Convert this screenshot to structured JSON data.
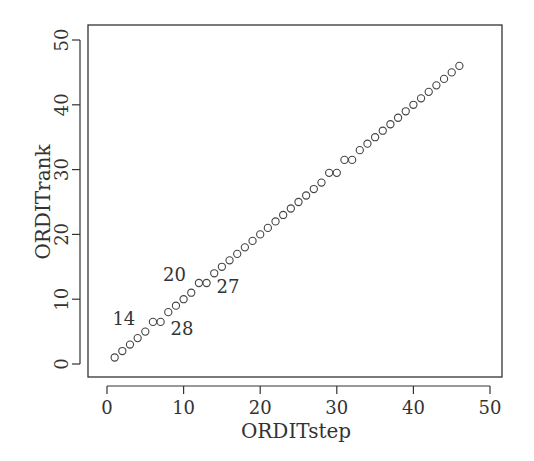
{
  "chart_data": {
    "type": "scatter",
    "title": "",
    "xlabel": "ORDITstep",
    "ylabel": "ORDITrank",
    "xlim": [
      -2,
      52
    ],
    "ylim": [
      -1.8,
      52.5
    ],
    "xticks": [
      0,
      10,
      20,
      30,
      40,
      50
    ],
    "yticks": [
      0,
      10,
      20,
      30,
      40,
      50
    ],
    "grid": false,
    "legend": null,
    "marker": "open-circle",
    "color": "#444444",
    "points": [
      [
        1,
        1
      ],
      [
        2,
        2
      ],
      [
        3,
        3
      ],
      [
        4,
        4
      ],
      [
        5,
        5
      ],
      [
        6,
        6.5
      ],
      [
        7,
        6.5
      ],
      [
        8,
        8
      ],
      [
        9,
        9
      ],
      [
        10,
        10
      ],
      [
        11,
        11
      ],
      [
        12,
        12.5
      ],
      [
        13,
        12.5
      ],
      [
        14,
        14
      ],
      [
        15,
        15
      ],
      [
        16,
        16
      ],
      [
        17,
        17
      ],
      [
        18,
        18
      ],
      [
        19,
        19
      ],
      [
        20,
        20
      ],
      [
        21,
        21
      ],
      [
        22,
        22
      ],
      [
        23,
        23
      ],
      [
        24,
        24
      ],
      [
        25,
        25
      ],
      [
        26,
        26
      ],
      [
        27,
        27
      ],
      [
        28,
        28
      ],
      [
        29,
        29.5
      ],
      [
        30,
        29.5
      ],
      [
        31,
        31.5
      ],
      [
        32,
        31.5
      ],
      [
        33,
        33
      ],
      [
        34,
        34
      ],
      [
        35,
        35
      ],
      [
        36,
        36
      ],
      [
        37,
        37
      ],
      [
        38,
        38
      ],
      [
        39,
        39
      ],
      [
        40,
        40
      ],
      [
        41,
        41
      ],
      [
        42,
        42
      ],
      [
        43,
        43
      ],
      [
        44,
        44
      ],
      [
        45,
        45
      ],
      [
        46,
        46
      ]
    ],
    "annotations": [
      {
        "text": "14",
        "x": 2.2,
        "y": 6.0
      },
      {
        "text": "28",
        "x": 9.8,
        "y": 4.5
      },
      {
        "text": "20",
        "x": 8.8,
        "y": 12.8
      },
      {
        "text": "27",
        "x": 15.8,
        "y": 11.0
      }
    ]
  }
}
